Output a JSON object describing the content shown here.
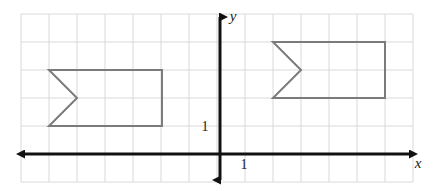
{
  "figure": {
    "background_color": "#ffffff",
    "width": 435,
    "height": 191
  },
  "grid": {
    "color": "#d9d9d9",
    "spacing_px": 28,
    "left_px": 21,
    "top_px": 14,
    "right_px": 413,
    "bottom_px": 182,
    "columns": 14,
    "rows": 6,
    "visible": true
  },
  "axes": {
    "color": "#111111",
    "origin_px": {
      "x": 220,
      "y": 154
    },
    "x_axis": {
      "label": "x",
      "label_px": {
        "x": 418,
        "y": 168
      },
      "start_px": {
        "x": 24,
        "y": 154
      },
      "end_px": {
        "x": 410,
        "y": 154
      },
      "arrows": "both"
    },
    "y_axis": {
      "label": "y",
      "label_px": {
        "x": 233,
        "y": 21
      },
      "start_px": {
        "x": 220,
        "y": 17
      },
      "end_px": {
        "x": 220,
        "y": 180
      },
      "arrows": "both"
    },
    "tick_labels": [
      {
        "text": "1",
        "axis": "y",
        "px": {
          "x": 205,
          "y": 131
        }
      },
      {
        "text": "1",
        "axis": "x",
        "px": {
          "x": 244,
          "y": 169
        }
      }
    ]
  },
  "shapes": [
    {
      "name": "left-flag",
      "stroke_color": "#7b7b7b",
      "stroke_width": 2,
      "fill": "none",
      "points_px": "49,70 162,70 162,126 49,126 77,98",
      "points_units": "(-6.11,3) (-2.07,3) (-2.07,1) (-6.11,1) (-5.11,2)"
    },
    {
      "name": "right-flag",
      "stroke_color": "#7b7b7b",
      "stroke_width": 2,
      "fill": "none",
      "points_px": "273,42 385,42 385,98 273,98 301,70",
      "points_units": "(1.89,4) (5.89,4) (5.89,2) (1.89,2) (2.89,3)"
    }
  ],
  "chart_data": {
    "type": "scatter",
    "xlabel": "x",
    "ylabel": "y",
    "grid": true,
    "legend": false,
    "unit_px": 28,
    "xlim": [
      -7.11,
      6.89
    ],
    "ylim": [
      -1,
      5
    ],
    "tick_labels": [
      "1",
      "1"
    ],
    "series": [
      {
        "name": "left-flag",
        "closed": true,
        "x": [
          -6.11,
          -2.07,
          -2.07,
          -6.11,
          -5.11
        ],
        "y": [
          3,
          3,
          1,
          1,
          2
        ]
      },
      {
        "name": "right-flag",
        "closed": true,
        "x": [
          1.89,
          5.89,
          5.89,
          1.89,
          2.89
        ],
        "y": [
          4,
          4,
          2,
          2,
          3
        ]
      }
    ]
  }
}
